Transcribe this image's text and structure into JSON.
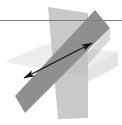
{
  "figure": {
    "width": 122,
    "height": 125,
    "background_color": "#ffffff",
    "caption": "",
    "elements": {
      "plane_horizontal_light": {
        "label": "horizontal plane (lightest)",
        "fill_color": "#ededed",
        "stroke_color": "none",
        "points": "4,62 46,44 118,52 74,74"
      },
      "plane_vertical_mid": {
        "label": "vertical plane (mid gray)",
        "fill_color": "#c9c9c9",
        "stroke_color": "none",
        "points": "48,7 88,13 88,118 58,119"
      },
      "plane_slanted_dark": {
        "label": "slanted plane (dark gray)",
        "fill_color": "#8f8f8f",
        "stroke_color": "none",
        "points": "95,10 110,28 25,113 15,96"
      },
      "line_horizontal": {
        "label": "horizontal reference line",
        "stroke_color": "#7b7b7b",
        "stroke_width": 1,
        "x1": 0,
        "y1": 20.5,
        "x2": 122,
        "y2": 20.5
      },
      "line_intersection_arrow": {
        "label": "line of intersection (double-headed arrow)",
        "stroke_color": "#151515",
        "stroke_width": 1.4,
        "x1": 24,
        "y1": 78,
        "x2": 92,
        "y2": 43,
        "arrowhead_start": "lower-left",
        "arrowhead_end": "upper-right",
        "arrowhead_length": 11,
        "arrowhead_width": 4.2
      }
    },
    "colors": {
      "lightest_plane": "#ededed",
      "mid_plane": "#c9c9c9",
      "dark_plane": "#8f8f8f",
      "line": "#151515",
      "reference_line": "#7b7b7b"
    }
  }
}
